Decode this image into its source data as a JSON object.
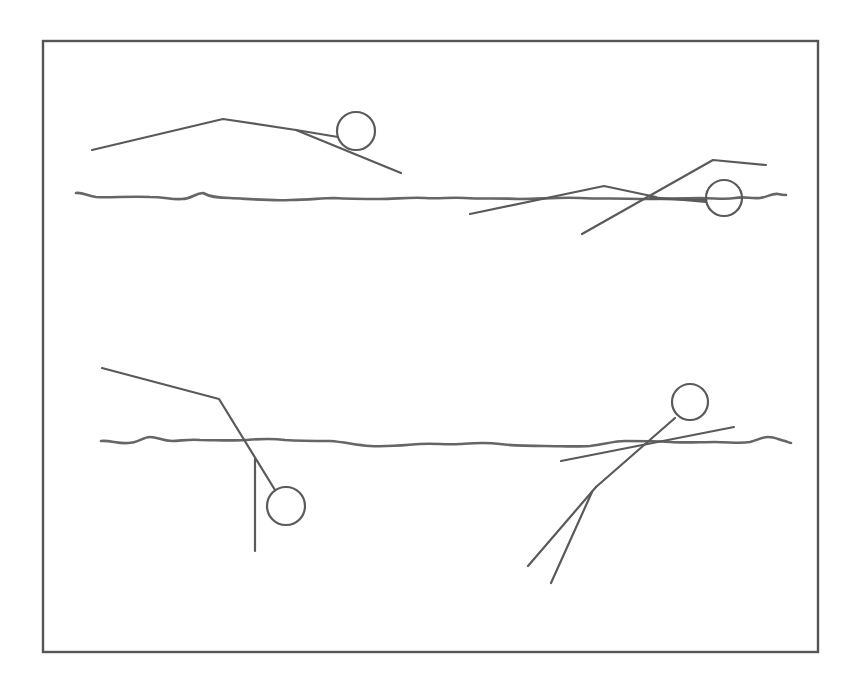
{
  "diagram": {
    "colors": {
      "stroke": "#5a5a5a",
      "frame": "#555555",
      "water": "#666666",
      "background": "#ffffff"
    },
    "frame": {
      "x": 43,
      "y": 41,
      "width": 775,
      "height": 611
    },
    "panels": [
      {
        "id": "top-left",
        "label": "swimmer floating above water, horizontal body"
      },
      {
        "id": "top-right",
        "label": "swimmer at water surface, arm extended"
      },
      {
        "id": "bottom-left",
        "label": "swimmer with head submerged, legs above water"
      },
      {
        "id": "bottom-right",
        "label": "swimmer upright at surface, legs below water"
      }
    ]
  }
}
